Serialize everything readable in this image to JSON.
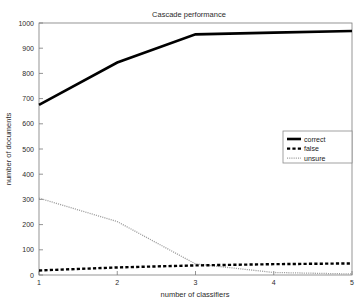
{
  "chart_data": {
    "type": "line",
    "title": "Cascade performance",
    "xlabel": "number of classifiers",
    "ylabel": "number of documents",
    "x": [
      1,
      2,
      3,
      4,
      5
    ],
    "xlim": [
      1,
      5
    ],
    "ylim": [
      0,
      1000
    ],
    "xticks": [
      "1",
      "2",
      "3",
      "4",
      "5"
    ],
    "yticks": [
      "0",
      "100",
      "200",
      "300",
      "400",
      "500",
      "600",
      "700",
      "800",
      "900",
      "1000"
    ],
    "grid": false,
    "legend_position": "center-right",
    "series": [
      {
        "name": "correct",
        "style": "solid",
        "color": "#000000",
        "values": [
          675,
          843,
          955,
          962,
          968
        ]
      },
      {
        "name": "false",
        "style": "dashed",
        "color": "#000000",
        "values": [
          18,
          30,
          38,
          43,
          46
        ]
      },
      {
        "name": "unsure",
        "style": "dotted",
        "color": "#9d9d9d",
        "values": [
          305,
          212,
          44,
          10,
          4
        ]
      }
    ],
    "legend": [
      {
        "label": "correct",
        "style": "solid",
        "color": "#000000"
      },
      {
        "label": "false",
        "style": "dashed",
        "color": "#000000"
      },
      {
        "label": "unsure",
        "style": "dotted",
        "color": "#9d9d9d"
      }
    ]
  },
  "colors": {
    "background": "#ffffff",
    "axis": "#7a7a7a",
    "text": "#2b2b2b",
    "correct": "#000000",
    "false": "#000000",
    "unsure": "#9d9d9d"
  }
}
